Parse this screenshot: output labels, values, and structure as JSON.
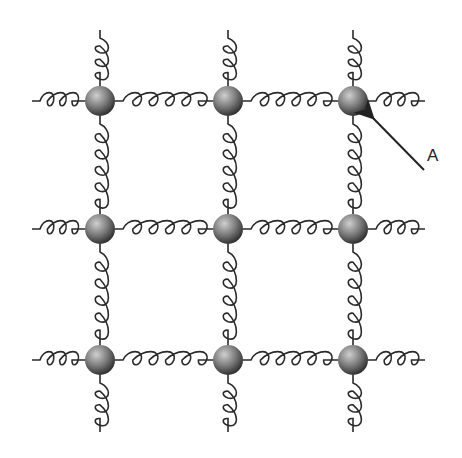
{
  "diagram": {
    "grid": {
      "rows": 3,
      "cols": 3
    },
    "node_x": [
      100,
      228,
      353
    ],
    "node_y": [
      101,
      229,
      360
    ],
    "node_radius": 15,
    "colors": {
      "line": "#2a2a2a",
      "ball_light": "#c8c8c8",
      "ball_dark": "#3c3c3c"
    },
    "label": {
      "text": "A",
      "x": 427,
      "y": 146,
      "points_to": "top-right ball"
    }
  }
}
